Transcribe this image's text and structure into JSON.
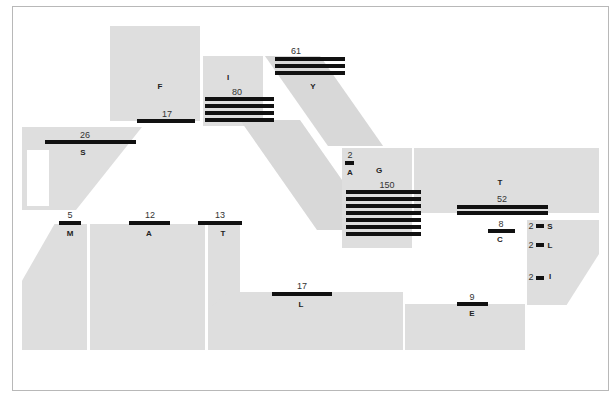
{
  "map": {
    "type": "floor-plan-zone-map",
    "groups": [
      {
        "id": "F",
        "name": "F",
        "value": "17",
        "bars": 1
      },
      {
        "id": "I",
        "name": "I",
        "value": "80",
        "bars": 4
      },
      {
        "id": "Y",
        "name": "Y",
        "value": "61",
        "bars": 3
      },
      {
        "id": "S1",
        "name": "S",
        "value": "26",
        "bars": 1
      },
      {
        "id": "A1",
        "name": "A",
        "value": "2",
        "bars": 1
      },
      {
        "id": "G",
        "name": "G",
        "value": "150",
        "bars": 7
      },
      {
        "id": "T1",
        "name": "T",
        "value": "52",
        "bars": 2
      },
      {
        "id": "C",
        "name": "C",
        "value": "8",
        "bars": 1
      },
      {
        "id": "S2",
        "name": "S",
        "value": "2",
        "bars": 1
      },
      {
        "id": "L1",
        "name": "L",
        "value": "2",
        "bars": 1
      },
      {
        "id": "I2",
        "name": "I",
        "value": "2",
        "bars": 1
      },
      {
        "id": "M",
        "name": "M",
        "value": "5",
        "bars": 1
      },
      {
        "id": "A2",
        "name": "A",
        "value": "12",
        "bars": 1
      },
      {
        "id": "T2",
        "name": "T",
        "value": "13",
        "bars": 1
      },
      {
        "id": "L2",
        "name": "L",
        "value": "17",
        "bars": 1
      },
      {
        "id": "E",
        "name": "E",
        "value": "9",
        "bars": 1
      }
    ]
  }
}
